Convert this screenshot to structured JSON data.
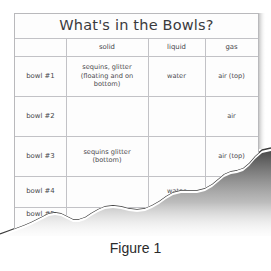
{
  "figure": {
    "caption": "Figure 1",
    "paper_color": "#fdfdfd",
    "line_color": "#c2c2c6",
    "text_color": "#46464a",
    "shadow_color": "#1a1a1a"
  },
  "table": {
    "title": "What's in the Bowls?",
    "corner_header": "",
    "column_headers": [
      "solid",
      "liquid",
      "gas"
    ],
    "rows": [
      {
        "label": "bowl #1",
        "solid": "sequins, glitter (floating and on bottom)",
        "liquid": "water",
        "gas": "air (top)"
      },
      {
        "label": "bowl #2",
        "solid": "",
        "liquid": "",
        "gas": "air"
      },
      {
        "label": "bowl #3",
        "solid": "sequins glitter (bottom)",
        "liquid": "",
        "gas": "air (top)"
      },
      {
        "label": "bowl #4",
        "solid": "",
        "liquid": "water",
        "gas": ""
      },
      {
        "label": "bowl #5",
        "solid": "",
        "liquid": "",
        "gas": ""
      }
    ]
  }
}
